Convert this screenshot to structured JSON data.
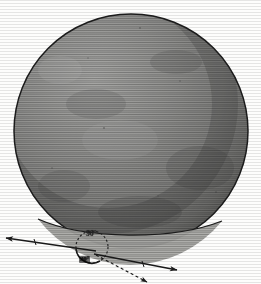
{
  "figure": {
    "background_color": "#fdfdfc",
    "ink_color": "#1a1a1a"
  },
  "sphere": {
    "name": "large-shaded-disc",
    "center_x": 131,
    "center_y": 131,
    "radius": 117,
    "fill_light": "#9a9a9a",
    "fill_dark": "#5e5e5e",
    "outline_color": "#1c1c1c",
    "texture": "horizontal-engraving-lines"
  },
  "limb_band": {
    "name": "lower-limb-crescent",
    "fill": "#a8a8a4",
    "outline": "#1c1c1c"
  },
  "detail_circle": {
    "name": "small-dashed-circle",
    "center_x": 92,
    "center_y": 247,
    "radius": 16,
    "stroke": "#2a2a2a",
    "dash": "2 2"
  },
  "labels": {
    "upper_angle": "90°",
    "lower_angle": "30°"
  },
  "rays": [
    {
      "name": "ray-upper-left-solid",
      "style": "solid",
      "arrowheads": "both",
      "from_x": 96,
      "from_y": 251,
      "to_x": 6,
      "to_y": 238
    },
    {
      "name": "ray-right-solid",
      "style": "solid",
      "arrowheads": "end",
      "from_x": 94,
      "from_y": 254,
      "to_x": 177,
      "to_y": 270
    },
    {
      "name": "ray-lower-right-dashed",
      "style": "dashed",
      "arrowheads": "end",
      "from_x": 96,
      "from_y": 255,
      "to_x": 147,
      "to_y": 282
    }
  ],
  "colors": {
    "paper": "#fdfdfc",
    "ink": "#1a1a1a",
    "mid_grey": "#8a8a8a",
    "dark_grey": "#5e5e5e"
  }
}
